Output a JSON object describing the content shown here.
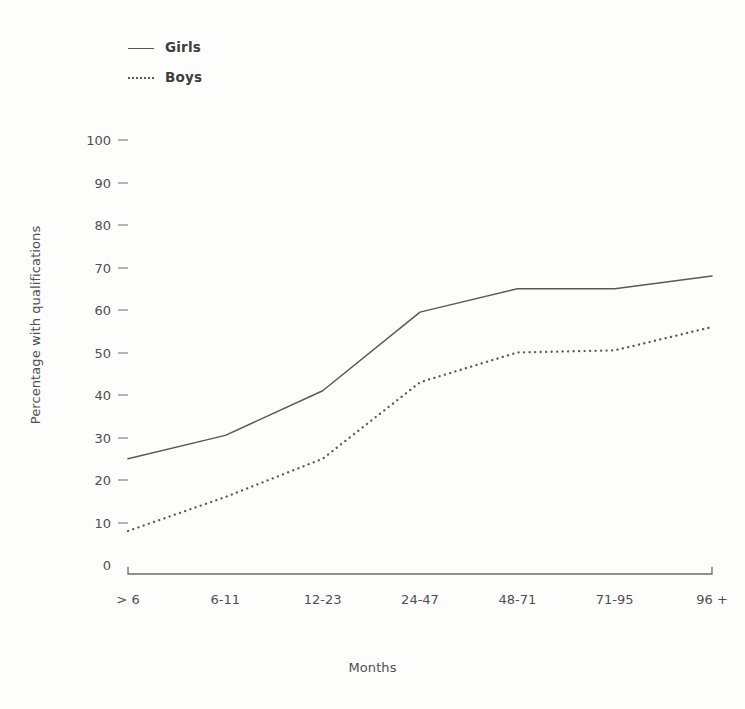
{
  "chart_data": {
    "type": "line",
    "title": "",
    "xlabel": "Months",
    "ylabel": "Percentage with qualifications",
    "categories": [
      "> 6",
      "6-11",
      "12-23",
      "24-47",
      "48-71",
      "71-95",
      "96 +"
    ],
    "yticks": [
      0,
      10,
      20,
      30,
      40,
      50,
      60,
      70,
      80,
      90,
      100
    ],
    "ylim": [
      0,
      100
    ],
    "grid": false,
    "legend_position": "top-left",
    "series": [
      {
        "name": "Girls",
        "style": "solid",
        "color": "#595959",
        "values": [
          25,
          30.5,
          41,
          59.5,
          65,
          65,
          68
        ]
      },
      {
        "name": "Boys",
        "style": "dotted",
        "color": "#595959",
        "values": [
          8,
          16,
          25,
          43,
          50,
          50.5,
          56
        ]
      }
    ]
  },
  "legend": {
    "items": [
      {
        "label": "Girls",
        "style": "solid"
      },
      {
        "label": "Boys",
        "style": "dotted"
      }
    ]
  },
  "axes": {
    "x_title": "Months",
    "y_title": "Percentage with qualifications"
  },
  "colors": {
    "line": "#595959",
    "axis": "#6b6b6b",
    "text": "#4f4f4f",
    "background": "#fdfdfb"
  }
}
